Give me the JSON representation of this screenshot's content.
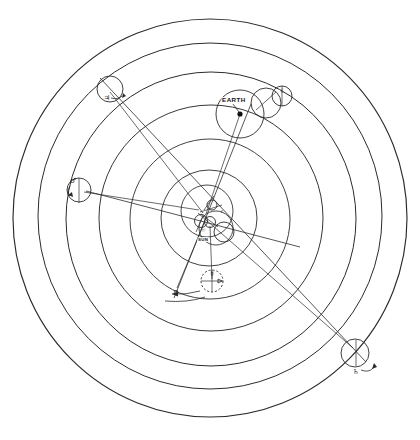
{
  "figure": {
    "kind": "heliocentric-orbit-diagram",
    "background_color": "#ffffff",
    "line_color": "#2b2b2b",
    "text_color": "#111111",
    "width": 420,
    "height": 440,
    "center": {
      "x": 210,
      "y": 218
    }
  },
  "labels": {
    "sun": "SUN",
    "earth": "EARTH"
  },
  "symbols": {
    "sun": "☉",
    "moon": "☾",
    "mercury": "☿",
    "venus": "♀",
    "mars": "♂",
    "jupiter": "♃",
    "saturn": "♄"
  },
  "orbits": [
    {
      "name": "saturn-orbit",
      "rx": 197,
      "ry": 199,
      "cx": 210,
      "cy": 218,
      "stroke_width": 1.1
    },
    {
      "name": "jupiter-orbit",
      "rx": 172,
      "ry": 173,
      "cx": 210,
      "cy": 216,
      "stroke_width": 1.0
    },
    {
      "name": "mars-orbit",
      "rx": 145,
      "ry": 147,
      "cx": 211,
      "cy": 219,
      "stroke_width": 1.0
    },
    {
      "name": "earth-orbit",
      "rx": 112,
      "ry": 113,
      "cx": 211,
      "cy": 218,
      "stroke_width": 0.95
    },
    {
      "name": "venus-orbit",
      "rx": 80,
      "ry": 80,
      "cx": 210,
      "cy": 219,
      "stroke_width": 0.9
    },
    {
      "name": "mercury-orbit",
      "rx": 48,
      "ry": 48,
      "cx": 209,
      "cy": 218,
      "stroke_width": 0.9
    },
    {
      "name": "inner-circle",
      "rx": 26,
      "ry": 26,
      "cx": 207,
      "cy": 211,
      "stroke_width": 0.85
    },
    {
      "name": "innermost-circle",
      "rx": 17,
      "ry": 17,
      "cx": 216,
      "cy": 228,
      "stroke_width": 0.85
    }
  ],
  "bodies": [
    {
      "name": "saturn",
      "symbol": "♄",
      "x": 355,
      "y": 353,
      "r": 14,
      "label": ""
    },
    {
      "name": "jupiter",
      "symbol": "♃",
      "x": 110,
      "y": 89,
      "r": 13,
      "label": ""
    },
    {
      "name": "mars",
      "symbol": "♂",
      "x": 79,
      "y": 190,
      "r": 12,
      "label": ""
    },
    {
      "name": "earth",
      "symbol": "",
      "x": 240,
      "y": 114,
      "r": 24,
      "label": "EARTH"
    },
    {
      "name": "moon",
      "symbol": "☾",
      "x": 274,
      "y": 97,
      "r": 10,
      "label": ""
    },
    {
      "name": "venus",
      "symbol": "♀",
      "x": 175,
      "y": 292,
      "r": 0,
      "label": ""
    },
    {
      "name": "mercury",
      "symbol": "☿",
      "x": 212,
      "y": 281,
      "r": 11,
      "label": ""
    },
    {
      "name": "sun",
      "symbol": "☉",
      "x": 205,
      "y": 229,
      "r": 0,
      "label": "SUN"
    }
  ],
  "radial_lines": [
    {
      "name": "ray-to-saturn",
      "x1": 197,
      "y1": 213,
      "x2": 357,
      "y2": 352
    },
    {
      "name": "ray-to-jupiter",
      "x1": 203,
      "y1": 214,
      "x2": 109,
      "y2": 92
    },
    {
      "name": "ray-to-mars",
      "x1": 199,
      "y1": 211,
      "x2": 84,
      "y2": 192
    },
    {
      "name": "ray-to-earth",
      "x1": 206,
      "y1": 214,
      "x2": 240,
      "y2": 114
    },
    {
      "name": "ray-to-mercury",
      "x1": 209,
      "y1": 228,
      "x2": 212,
      "y2": 281
    },
    {
      "name": "ray-to-venus",
      "x1": 205,
      "y1": 222,
      "x2": 176,
      "y2": 290
    },
    {
      "name": "sightline-saturn-jupiter",
      "x1": 104,
      "y1": 84,
      "x2": 362,
      "y2": 358
    },
    {
      "name": "sightline-earth-down",
      "x1": 248,
      "y1": 107,
      "x2": 176,
      "y2": 296
    }
  ]
}
